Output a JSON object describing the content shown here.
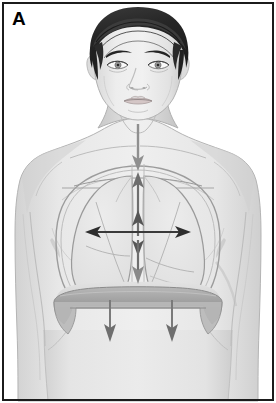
{
  "figure": {
    "panel_label": "A",
    "width": 276,
    "height": 403
  },
  "colors": {
    "frame_border": "#1b1b1b",
    "background": "#ffffff",
    "skin_light": "#ebebeb",
    "skin_mid": "#dcdcdc",
    "skin_shadow": "#c9c9c9",
    "skin_outline": "#a8a8a8",
    "hair_dark": "#2b2b2b",
    "hair_highlight": "#4a4a4a",
    "lung_fill": "#e3e3e3",
    "lung_outline": "#8f8f8f",
    "diaphragm_dark": "#9a9a9a",
    "diaphragm_light": "#cfcfcf",
    "arrow_dark": "#3a3a3a",
    "arrow_gray": "#8a8a8a",
    "eye_iris": "#8a8a8a",
    "lip": "#cdbdbd"
  },
  "anatomy": {
    "parts": [
      {
        "name": "head",
        "label": "head"
      },
      {
        "name": "hair",
        "label": "hair"
      },
      {
        "name": "face",
        "label": "face"
      },
      {
        "name": "left-eye",
        "label": "left eye"
      },
      {
        "name": "right-eye",
        "label": "right eye"
      },
      {
        "name": "nose",
        "label": "nose"
      },
      {
        "name": "mouth",
        "label": "mouth"
      },
      {
        "name": "neck",
        "label": "neck"
      },
      {
        "name": "left-shoulder",
        "label": "left shoulder"
      },
      {
        "name": "right-shoulder",
        "label": "right shoulder"
      },
      {
        "name": "torso",
        "label": "torso"
      },
      {
        "name": "left-lung",
        "label": "left lung"
      },
      {
        "name": "right-lung",
        "label": "right lung"
      },
      {
        "name": "trachea",
        "label": "trachea"
      },
      {
        "name": "ribcage",
        "label": "ribcage / thoracic wall"
      },
      {
        "name": "diaphragm",
        "label": "diaphragm"
      },
      {
        "name": "abdomen",
        "label": "abdomen"
      }
    ]
  },
  "arrows": {
    "items": [
      {
        "name": "airflow-arrow",
        "label": "air flow into trachea",
        "direction": "down",
        "color": "#8a8a8a",
        "from": [
          138,
          126
        ],
        "to": [
          138,
          168
        ]
      },
      {
        "name": "vertical-expansion-arrow",
        "label": "vertical (superior-inferior) thoracic expansion",
        "direction": "double-vertical",
        "color": "#6e6e6e",
        "from": [
          138,
          172
        ],
        "to": [
          138,
          280
        ]
      },
      {
        "name": "horizontal-expansion-arrow",
        "label": "transverse (lateral) thoracic expansion",
        "direction": "double-horizontal",
        "color": "#3a3a3a",
        "from": [
          86,
          232
        ],
        "to": [
          190,
          232
        ]
      },
      {
        "name": "diaphragm-descent-arrow-left",
        "label": "diaphragm descends",
        "direction": "down",
        "color": "#6e6e6e",
        "from": [
          110,
          302
        ],
        "to": [
          110,
          338
        ]
      },
      {
        "name": "diaphragm-descent-arrow-right",
        "label": "diaphragm descends",
        "direction": "down",
        "color": "#6e6e6e",
        "from": [
          172,
          302
        ],
        "to": [
          172,
          338
        ]
      }
    ]
  }
}
